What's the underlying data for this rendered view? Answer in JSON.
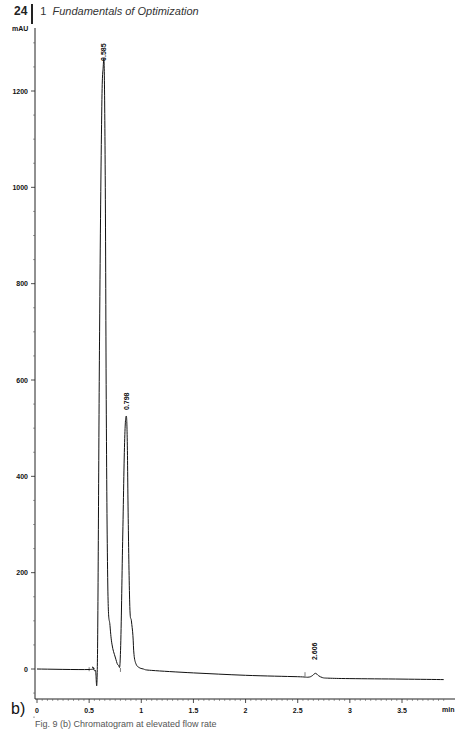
{
  "header": {
    "page_number": "24",
    "chapter_number": "1",
    "chapter_title": "Fundamentals of Optimization"
  },
  "panel_label": "b)",
  "caption": "Fig. 9 (b) Chromatogram at elevated flow rate",
  "chart_data": {
    "type": "line",
    "title": "",
    "xlabel": "min",
    "ylabel": "mAU",
    "xlim": [
      -0.02,
      3.9
    ],
    "ylim": [
      -150,
      1330
    ],
    "grid": false,
    "legend": null,
    "x_ticks": [
      0,
      0.5,
      1,
      1.5,
      2,
      2.5,
      3,
      3.5
    ],
    "x_tick_labels": [
      "0",
      "0.5",
      "1",
      "1.5",
      "2",
      "2.5",
      "3",
      "3.5"
    ],
    "y_ticks": [
      0,
      200,
      400,
      600,
      800,
      1000,
      1200
    ],
    "y_tick_labels": [
      "0",
      "200",
      "400",
      "600",
      "800",
      "1000",
      "1200"
    ],
    "peaks": [
      {
        "label": "0.585",
        "retention_time": 0.64,
        "height": 1250
      },
      {
        "label": "0.798",
        "retention_time": 0.86,
        "height": 525
      },
      {
        "label": "2.606",
        "retention_time": 2.67,
        "height": 6
      }
    ],
    "series": [
      {
        "name": "chromatogram",
        "x": [
          0.0,
          0.5,
          0.53,
          0.56,
          0.58,
          0.6,
          0.62,
          0.635,
          0.645,
          0.655,
          0.665,
          0.68,
          0.7,
          0.72,
          0.75,
          0.78,
          0.8,
          0.82,
          0.84,
          0.855,
          0.865,
          0.875,
          0.89,
          0.905,
          0.92,
          0.93,
          0.95,
          0.98,
          1.02,
          1.1,
          1.5,
          2.0,
          2.5,
          2.6,
          2.64,
          2.67,
          2.7,
          2.74,
          2.8,
          3.0,
          3.5,
          3.9
        ],
        "y": [
          0,
          -1,
          4,
          -3,
          30,
          700,
          1150,
          1250,
          1240,
          1000,
          500,
          160,
          90,
          50,
          25,
          8,
          30,
          250,
          470,
          525,
          480,
          300,
          130,
          100,
          70,
          30,
          10,
          3,
          0,
          -3,
          -8,
          -13,
          -16,
          -17,
          -14,
          -9,
          -14,
          -18,
          -19,
          -20,
          -21,
          -22
        ]
      }
    ]
  }
}
